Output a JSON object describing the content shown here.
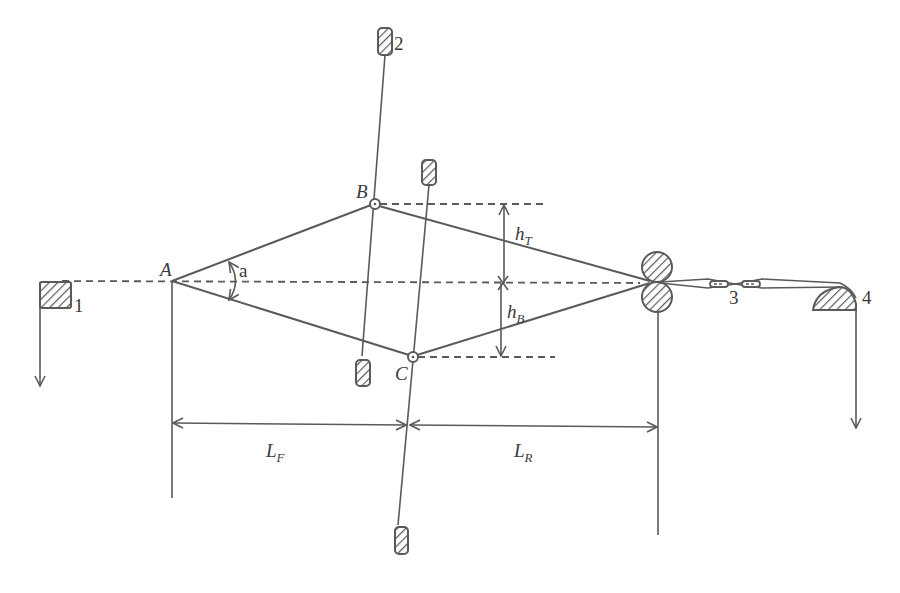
{
  "diagram": {
    "type": "mechanism-schematic",
    "colors": {
      "line": "#5a5a5a",
      "text": "#3a3a3a",
      "background": "#ffffff"
    },
    "points": {
      "A": {
        "label": "A",
        "x": 172,
        "y": 281
      },
      "B": {
        "label": "B",
        "x": 375,
        "y": 204
      },
      "C": {
        "label": "C",
        "x": 413,
        "y": 357
      },
      "nip": {
        "x": 657,
        "y": 282
      }
    },
    "angle_label": "a",
    "heights": {
      "top": {
        "main": "h",
        "sub": "T"
      },
      "bottom": {
        "main": "h",
        "sub": "B"
      }
    },
    "lengths": {
      "front": {
        "main": "L",
        "sub": "F"
      },
      "rear": {
        "main": "L",
        "sub": "R"
      }
    },
    "components": [
      {
        "id": "1",
        "label": "1",
        "shape": "hatched-square-with-down-arrow"
      },
      {
        "id": "2",
        "label": "2",
        "shape": "hatched-pin-top-of-rod-B"
      },
      {
        "id": "3",
        "label": "3",
        "shape": "pair-of-slotted-links"
      },
      {
        "id": "4",
        "label": "4",
        "shape": "hatched-quarter-round-with-down-arrow"
      }
    ]
  }
}
